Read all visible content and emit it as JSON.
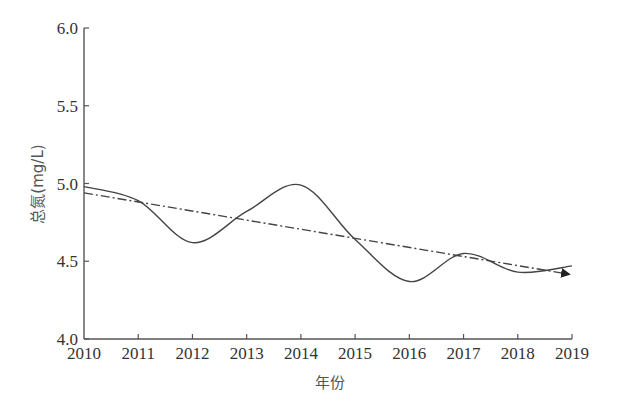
{
  "chart_data": {
    "type": "line",
    "title": "",
    "xlabel": "年份",
    "ylabel": "总氮(mg/L)",
    "x": [
      2010,
      2011,
      2012,
      2013,
      2014,
      2015,
      2016,
      2017,
      2018,
      2019
    ],
    "x_tick_labels": [
      "2010",
      "2011",
      "2012",
      "2013",
      "2014",
      "2015",
      "2016",
      "2017",
      "2018",
      "2019"
    ],
    "y_tick_labels": [
      "4.0",
      "4.5",
      "5.0",
      "5.5",
      "6.0"
    ],
    "y_ticks": [
      4.0,
      4.5,
      5.0,
      5.5,
      6.0
    ],
    "ylim": [
      4.0,
      6.0
    ],
    "xlim": [
      2010,
      2019
    ],
    "grid": false,
    "legend": null,
    "series": [
      {
        "name": "总氮",
        "style": "solid smooth",
        "values": [
          4.98,
          4.89,
          4.62,
          4.82,
          4.99,
          4.64,
          4.37,
          4.55,
          4.43,
          4.47
        ]
      },
      {
        "name": "趋势线",
        "style": "dash-dot with arrowhead",
        "start": {
          "x": 2010,
          "y": 4.94
        },
        "end": {
          "x": 2019,
          "y": 4.42
        }
      }
    ],
    "colors": {
      "line": "#444444",
      "axis": "#555555"
    }
  }
}
